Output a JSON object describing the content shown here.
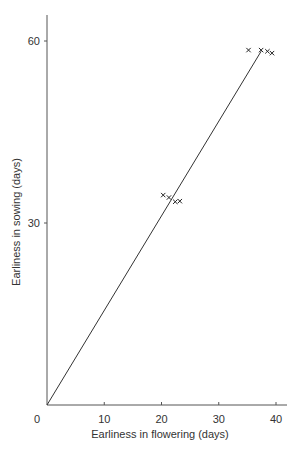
{
  "chart_data": {
    "type": "scatter",
    "title": "",
    "xlabel": "Earliness in flowering (days)",
    "ylabel": "Earliness in sowing (days)",
    "xlim": [
      0,
      41
    ],
    "ylim": [
      0,
      65
    ],
    "x_ticks": [
      0,
      10,
      20,
      30,
      40
    ],
    "y_ticks": [
      30,
      60
    ],
    "grid": false,
    "legend": null,
    "marker": "x",
    "series": [
      {
        "name": "observations",
        "points": [
          {
            "x": 20.3,
            "y": 34.6
          },
          {
            "x": 21.3,
            "y": 34.2
          },
          {
            "x": 22.4,
            "y": 33.5
          },
          {
            "x": 23.2,
            "y": 33.6
          },
          {
            "x": 35.2,
            "y": 58.5
          },
          {
            "x": 37.4,
            "y": 58.5
          },
          {
            "x": 38.5,
            "y": 58.3
          },
          {
            "x": 39.3,
            "y": 58.0
          }
        ]
      }
    ],
    "line": {
      "name": "fit",
      "from": {
        "x": 0,
        "y": 0
      },
      "to": {
        "x": 37.4,
        "y": 58.3
      }
    }
  },
  "axes": {
    "x_tick_labels": [
      "0",
      "10",
      "20",
      "30",
      "40"
    ],
    "y_tick_labels": [
      "30",
      "60"
    ]
  }
}
